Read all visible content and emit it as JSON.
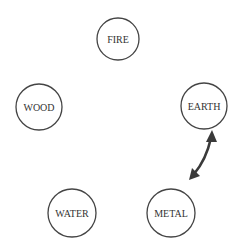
{
  "diagram": {
    "type": "five-elements-cycle",
    "nodes": [
      {
        "id": "fire",
        "label": "FIRE",
        "cx": 118,
        "cy": 39,
        "r": 21
      },
      {
        "id": "earth",
        "label": "EARTH",
        "cx": 204,
        "cy": 106,
        "r": 23
      },
      {
        "id": "metal",
        "label": "METAL",
        "cx": 171,
        "cy": 213,
        "r": 24
      },
      {
        "id": "water",
        "label": "WATER",
        "cx": 72,
        "cy": 213,
        "r": 24
      },
      {
        "id": "wood",
        "label": "WOOD",
        "cx": 39,
        "cy": 107,
        "r": 23
      }
    ],
    "edges": [
      {
        "from": "earth",
        "to": "metal",
        "bidirectional": true,
        "color": "#3a3a3a"
      }
    ]
  }
}
